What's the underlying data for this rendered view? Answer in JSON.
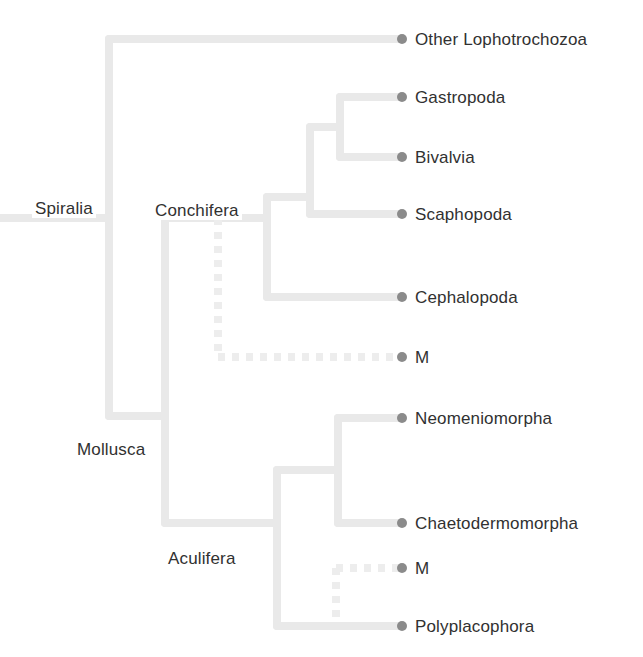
{
  "figure": {
    "kind": "cladogram",
    "background_color": "#ffffff",
    "branch_color": "#e9e9e9",
    "branch_dashed_color": "#ededed",
    "tip_dot_color": "#8b8b8b",
    "text_color": "#313131",
    "branch_width": 8,
    "tip_dot_radius": 5
  },
  "tips": [
    {
      "id": "other-lophotrochozoa",
      "label": "Other Lophotrochozoa",
      "x": 402,
      "y": 39,
      "dashed": false
    },
    {
      "id": "gastropoda",
      "label": "Gastropoda",
      "x": 402,
      "y": 97,
      "dashed": false
    },
    {
      "id": "bivalvia",
      "label": "Bivalvia",
      "x": 402,
      "y": 157,
      "dashed": false
    },
    {
      "id": "scaphopoda",
      "label": "Scaphopoda",
      "x": 402,
      "y": 214,
      "dashed": false
    },
    {
      "id": "cephalopoda",
      "label": "Cephalopoda",
      "x": 402,
      "y": 297,
      "dashed": false
    },
    {
      "id": "monoplacophora-upper",
      "label": "M",
      "x": 402,
      "y": 357,
      "dashed": true
    },
    {
      "id": "neomeniomorpha",
      "label": "Neomeniomorpha",
      "x": 402,
      "y": 418,
      "dashed": false
    },
    {
      "id": "chaetodermomorpha",
      "label": "Chaetodermomorpha",
      "x": 402,
      "y": 523,
      "dashed": false
    },
    {
      "id": "monoplacophora-lower",
      "label": "M",
      "x": 402,
      "y": 568,
      "dashed": true
    },
    {
      "id": "polyplacophora",
      "label": "Polyplacophora",
      "x": 402,
      "y": 626,
      "dashed": false
    }
  ],
  "clade_labels": [
    {
      "id": "spiralia",
      "label": "Spiralia",
      "x": 32,
      "y": 199
    },
    {
      "id": "conchifera",
      "label": "Conchifera",
      "x": 152,
      "y": 201
    },
    {
      "id": "mollusca",
      "label": "Mollusca",
      "x": 74,
      "y": 440
    },
    {
      "id": "aculifera",
      "label": "Aculifera",
      "x": 165,
      "y": 549
    }
  ],
  "nodes": [
    {
      "id": "root-stem",
      "type": "horizontal",
      "x1": 0,
      "x2": 109,
      "y": 218,
      "dashed": false
    },
    {
      "id": "spiralia-node",
      "type": "vertical",
      "x": 109,
      "y1": 39,
      "y2": 416,
      "dashed": false
    },
    {
      "id": "branch-other-loph",
      "type": "horizontal",
      "x1": 109,
      "x2": 402,
      "y": 39,
      "dashed": false
    },
    {
      "id": "mollusca-node",
      "type": "vertical",
      "x": 165,
      "y1": 218,
      "y2": 523,
      "dashed": false
    },
    {
      "id": "branch-mollusca",
      "type": "horizontal",
      "x1": 109,
      "x2": 165,
      "y": 416,
      "dashed": false
    },
    {
      "id": "branch-conchifera",
      "type": "horizontal",
      "x1": 165,
      "x2": 267,
      "y": 218,
      "dashed": false
    },
    {
      "id": "branch-aculifera",
      "type": "horizontal",
      "x1": 165,
      "x2": 277,
      "y": 523,
      "dashed": false
    },
    {
      "id": "conchifera-node",
      "type": "vertical",
      "x": 267,
      "y1": 197,
      "y2": 297,
      "dashed": false
    },
    {
      "id": "branch-cephalopoda",
      "type": "horizontal",
      "x1": 267,
      "x2": 402,
      "y": 297,
      "dashed": false
    },
    {
      "id": "branch-testaria",
      "type": "horizontal",
      "x1": 267,
      "x2": 310,
      "y": 197,
      "dashed": false
    },
    {
      "id": "testaria-node",
      "type": "vertical",
      "x": 310,
      "y1": 127,
      "y2": 214,
      "dashed": false
    },
    {
      "id": "branch-scaphopoda",
      "type": "horizontal",
      "x1": 310,
      "x2": 402,
      "y": 214,
      "dashed": false
    },
    {
      "id": "branch-pleisto",
      "type": "horizontal",
      "x1": 310,
      "x2": 340,
      "y": 127,
      "dashed": false
    },
    {
      "id": "pleisto-node",
      "type": "vertical",
      "x": 340,
      "y1": 97,
      "y2": 157,
      "dashed": false
    },
    {
      "id": "branch-gastropoda",
      "type": "horizontal",
      "x1": 340,
      "x2": 402,
      "y": 97,
      "dashed": false
    },
    {
      "id": "branch-bivalvia",
      "type": "horizontal",
      "x1": 340,
      "x2": 402,
      "y": 157,
      "dashed": false
    },
    {
      "id": "mono-upper-stem",
      "type": "vertical",
      "x": 218,
      "y1": 218,
      "y2": 357,
      "dashed": true
    },
    {
      "id": "branch-mono-upper",
      "type": "horizontal",
      "x1": 218,
      "x2": 402,
      "y": 357,
      "dashed": true
    },
    {
      "id": "aculifera-node",
      "type": "vertical",
      "x": 277,
      "y1": 470,
      "y2": 626,
      "dashed": false
    },
    {
      "id": "branch-polyplaco",
      "type": "horizontal",
      "x1": 277,
      "x2": 402,
      "y": 626,
      "dashed": false
    },
    {
      "id": "branch-aplacophora",
      "type": "horizontal",
      "x1": 277,
      "x2": 338,
      "y": 470,
      "dashed": false
    },
    {
      "id": "aplacophora-node",
      "type": "vertical",
      "x": 338,
      "y1": 418,
      "y2": 523,
      "dashed": false
    },
    {
      "id": "branch-neomenio",
      "type": "horizontal",
      "x1": 338,
      "x2": 402,
      "y": 418,
      "dashed": false
    },
    {
      "id": "branch-chaetoderm",
      "type": "horizontal",
      "x1": 338,
      "x2": 402,
      "y": 523,
      "dashed": false
    },
    {
      "id": "mono-lower-stem",
      "type": "vertical",
      "x": 336,
      "y1": 568,
      "y2": 620,
      "dashed": true
    },
    {
      "id": "branch-mono-lower",
      "type": "horizontal",
      "x1": 336,
      "x2": 402,
      "y": 568,
      "dashed": true
    }
  ]
}
